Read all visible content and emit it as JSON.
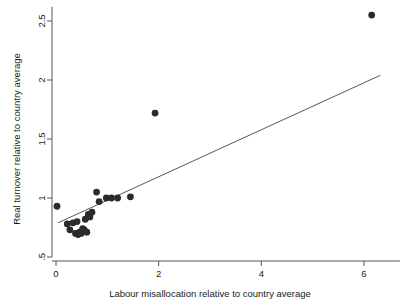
{
  "chart_data": {
    "type": "scatter",
    "title": "",
    "xlabel": "Labour misallocation relative to country average",
    "ylabel": "Real turnover relative to country average",
    "xlim": [
      -0.12,
      6.7
    ],
    "ylim": [
      0.46,
      2.62
    ],
    "grid": false,
    "legend": null,
    "xticks": [
      0,
      2,
      4,
      6
    ],
    "xtick_labels": [
      "0",
      "2",
      "4",
      "6"
    ],
    "yticks": [
      0.5,
      1,
      1.5,
      2,
      2.5
    ],
    "ytick_labels": [
      ".5",
      "1",
      "1.5",
      "2",
      "2.5"
    ],
    "series": [
      {
        "name": "observations",
        "marker": "circle",
        "color": "#2b2b2b",
        "points": [
          {
            "x": 0.02,
            "y": 0.93
          },
          {
            "x": 0.22,
            "y": 0.78
          },
          {
            "x": 0.27,
            "y": 0.73
          },
          {
            "x": 0.33,
            "y": 0.79
          },
          {
            "x": 0.38,
            "y": 0.7
          },
          {
            "x": 0.41,
            "y": 0.8
          },
          {
            "x": 0.43,
            "y": 0.69
          },
          {
            "x": 0.46,
            "y": 0.71
          },
          {
            "x": 0.49,
            "y": 0.7
          },
          {
            "x": 0.52,
            "y": 0.74
          },
          {
            "x": 0.55,
            "y": 0.73
          },
          {
            "x": 0.57,
            "y": 0.82
          },
          {
            "x": 0.6,
            "y": 0.71
          },
          {
            "x": 0.63,
            "y": 0.86
          },
          {
            "x": 0.66,
            "y": 0.84
          },
          {
            "x": 0.7,
            "y": 0.88
          },
          {
            "x": 0.79,
            "y": 1.05
          },
          {
            "x": 0.84,
            "y": 0.97
          },
          {
            "x": 0.98,
            "y": 1.0
          },
          {
            "x": 1.08,
            "y": 1.0
          },
          {
            "x": 1.2,
            "y": 1.0
          },
          {
            "x": 1.45,
            "y": 1.01
          },
          {
            "x": 1.93,
            "y": 1.72
          },
          {
            "x": 6.15,
            "y": 2.55
          }
        ]
      }
    ],
    "fit_line": {
      "name": "linear-fit",
      "color": "#58585c",
      "x_start": 0.04,
      "y_start": 0.79,
      "x_end": 6.32,
      "y_end": 2.04
    }
  },
  "plot_geometry": {
    "x_pixel_at_0": 56,
    "x_pixel_at_6": 364,
    "y_pixel_at_0_5": 257,
    "y_pixel_at_2_5": 21,
    "marker_radius": 3.4
  }
}
